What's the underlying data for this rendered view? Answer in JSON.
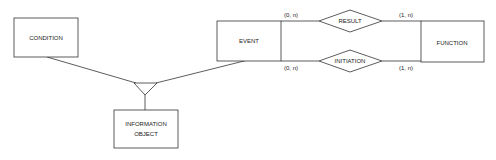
{
  "diagram": {
    "type": "entity-relationship",
    "entities": [
      {
        "id": "condition",
        "label": "CONDITION"
      },
      {
        "id": "event",
        "label": "EVENT"
      },
      {
        "id": "function",
        "label": "FUNCTION"
      },
      {
        "id": "information_object",
        "label_line1": "INFORMATION",
        "label_line2": "OBJECT"
      }
    ],
    "relationships": [
      {
        "id": "result",
        "label": "RESULT",
        "from_cardinality": "(0, n)",
        "to_cardinality": "(1, n)"
      },
      {
        "id": "initiation",
        "label": "INITIATION",
        "from_cardinality": "(0, n)",
        "to_cardinality": "(1, n)"
      }
    ],
    "generalization": {
      "children": [
        "condition",
        "event"
      ],
      "parent": "information_object"
    },
    "colors": {
      "stroke": "#333333",
      "background": "#ffffff",
      "text": "#222222"
    }
  }
}
